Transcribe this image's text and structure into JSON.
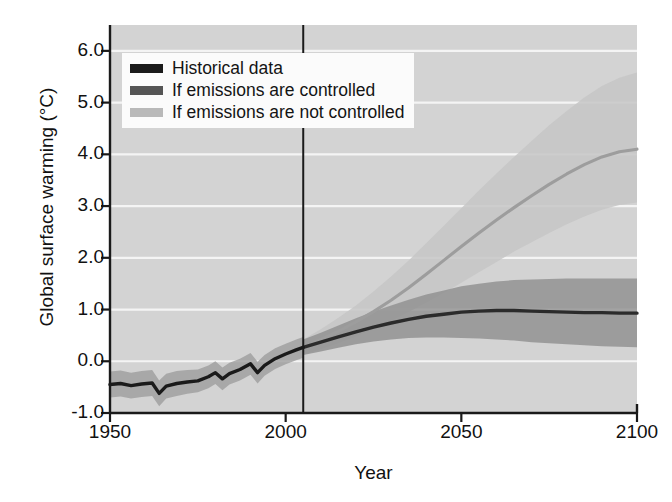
{
  "chart_data": {
    "type": "line",
    "title": "",
    "xlabel": "Year",
    "ylabel": "Global surface warming (°C)",
    "xlim": [
      1950,
      2100
    ],
    "ylim": [
      -1.0,
      6.5
    ],
    "xticks": [
      1950,
      2000,
      2050,
      2100
    ],
    "yticks": [
      -1.0,
      0.0,
      1.0,
      2.0,
      3.0,
      4.0,
      5.0,
      6.0
    ],
    "ytick_labels": [
      "-1.0",
      "0.0",
      "1.0",
      "2.0",
      "3.0",
      "4.0",
      "5.0",
      "6.0"
    ],
    "xtick_labels": [
      "1950",
      "2000",
      "2050",
      "2100"
    ],
    "grid": "horizontal-white",
    "legend_position": "upper-left",
    "divider_year": 2005,
    "series": [
      {
        "name": "Historical data",
        "color": "#1a1a1a",
        "band_color": "#9a9a9a",
        "x": [
          1950,
          1953,
          1956,
          1959,
          1962,
          1964,
          1966,
          1969,
          1972,
          1975,
          1978,
          1980,
          1982,
          1984,
          1987,
          1990,
          1992,
          1994,
          1997,
          2000,
          2003,
          2005
        ],
        "values": [
          -0.45,
          -0.43,
          -0.47,
          -0.44,
          -0.42,
          -0.62,
          -0.48,
          -0.43,
          -0.4,
          -0.38,
          -0.3,
          -0.22,
          -0.34,
          -0.24,
          -0.16,
          -0.05,
          -0.22,
          -0.08,
          0.05,
          0.14,
          0.22,
          0.27
        ],
        "band_lower": [
          -0.7,
          -0.68,
          -0.72,
          -0.69,
          -0.67,
          -0.87,
          -0.72,
          -0.67,
          -0.63,
          -0.6,
          -0.52,
          -0.44,
          -0.56,
          -0.45,
          -0.37,
          -0.26,
          -0.43,
          -0.28,
          -0.15,
          -0.06,
          0.02,
          0.07
        ],
        "band_upper": [
          -0.2,
          -0.18,
          -0.22,
          -0.19,
          -0.17,
          -0.37,
          -0.24,
          -0.19,
          -0.17,
          -0.16,
          -0.08,
          0.0,
          -0.12,
          -0.03,
          0.05,
          0.16,
          -0.01,
          0.12,
          0.25,
          0.34,
          0.42,
          0.47
        ]
      },
      {
        "name": "If emissions are controlled",
        "color": "#2b2b2b",
        "band_color": "#8e8e8e",
        "x": [
          2005,
          2010,
          2015,
          2020,
          2025,
          2030,
          2035,
          2040,
          2045,
          2050,
          2055,
          2060,
          2065,
          2070,
          2075,
          2080,
          2085,
          2090,
          2095,
          2100
        ],
        "values": [
          0.27,
          0.37,
          0.47,
          0.57,
          0.66,
          0.74,
          0.81,
          0.87,
          0.91,
          0.95,
          0.97,
          0.98,
          0.98,
          0.97,
          0.96,
          0.95,
          0.94,
          0.94,
          0.93,
          0.93
        ],
        "band_lower": [
          0.12,
          0.19,
          0.26,
          0.33,
          0.38,
          0.42,
          0.45,
          0.46,
          0.46,
          0.45,
          0.44,
          0.42,
          0.4,
          0.37,
          0.35,
          0.33,
          0.31,
          0.29,
          0.28,
          0.27
        ],
        "band_upper": [
          0.42,
          0.55,
          0.69,
          0.83,
          0.96,
          1.08,
          1.19,
          1.29,
          1.37,
          1.45,
          1.5,
          1.54,
          1.57,
          1.58,
          1.59,
          1.6,
          1.6,
          1.6,
          1.6,
          1.6
        ]
      },
      {
        "name": "If emissions are not controlled",
        "color": "#9d9d9d",
        "band_color": "#c6c6c6",
        "x": [
          2005,
          2010,
          2015,
          2020,
          2025,
          2030,
          2035,
          2040,
          2045,
          2050,
          2055,
          2060,
          2065,
          2070,
          2075,
          2080,
          2085,
          2090,
          2095,
          2100
        ],
        "values": [
          0.27,
          0.42,
          0.58,
          0.76,
          0.96,
          1.18,
          1.42,
          1.68,
          1.95,
          2.22,
          2.48,
          2.73,
          2.97,
          3.2,
          3.42,
          3.62,
          3.8,
          3.95,
          4.05,
          4.1
        ],
        "band_lower": [
          0.12,
          0.23,
          0.35,
          0.48,
          0.62,
          0.78,
          0.95,
          1.13,
          1.32,
          1.52,
          1.72,
          1.92,
          2.12,
          2.3,
          2.48,
          2.65,
          2.8,
          2.93,
          3.02,
          3.07
        ],
        "band_upper": [
          0.42,
          0.62,
          0.84,
          1.08,
          1.35,
          1.64,
          1.95,
          2.28,
          2.62,
          2.96,
          3.3,
          3.63,
          3.95,
          4.26,
          4.56,
          4.84,
          5.1,
          5.32,
          5.48,
          5.58
        ]
      }
    ]
  },
  "legend": {
    "items": [
      {
        "label": "Historical data",
        "swatch": "#1a1a1a"
      },
      {
        "label": "If emissions are controlled",
        "swatch": "#555555"
      },
      {
        "label": "If emissions are not controlled",
        "swatch": "#b9b9b9"
      }
    ]
  },
  "axes": {
    "y_title": "Global surface warming (°C)",
    "x_title": "Year"
  }
}
